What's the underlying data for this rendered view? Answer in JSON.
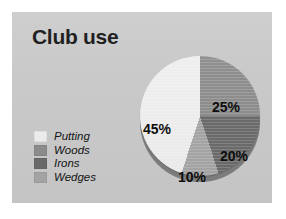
{
  "slide": {
    "title": "Club use",
    "background_color": "#c9c9c9",
    "page_background": "#ffffff"
  },
  "legend": {
    "items": [
      {
        "label": "Putting",
        "color": "#eeeeee"
      },
      {
        "label": "Woods",
        "color": "#8d8d8d"
      },
      {
        "label": "Irons",
        "color": "#6b6b6b"
      },
      {
        "label": "Wedges",
        "color": "#a6a6a6"
      }
    ]
  },
  "chart_data": {
    "type": "pie",
    "title": "Club use",
    "categories": [
      "Putting",
      "Woods",
      "Irons",
      "Wedges"
    ],
    "values": [
      45,
      25,
      20,
      10
    ],
    "value_labels": [
      "45%",
      "25%",
      "20%",
      "10%"
    ],
    "colors": [
      "#eeeeee",
      "#8d8d8d",
      "#6b6b6b",
      "#a6a6a6"
    ],
    "units": "percent",
    "total": 100,
    "legend_position": "left",
    "grid": false,
    "start_angle_deg": 0,
    "direction": "clockwise",
    "labels": {
      "putting": "45%",
      "woods": "25%",
      "irons": "20%",
      "wedges": "10%"
    }
  }
}
